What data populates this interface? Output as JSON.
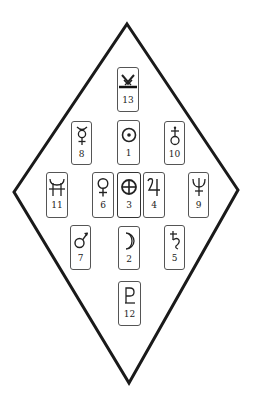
{
  "diagram": {
    "shape": "diamond",
    "vertices": {
      "top": [
        127,
        24
      ],
      "right": [
        238,
        190
      ],
      "bottom": [
        129,
        383
      ],
      "left": [
        14,
        192
      ]
    },
    "stroke_color": "#1a1a1a",
    "cards": [
      {
        "number": "13",
        "symbol": "uranian-vulcanus-icon",
        "x": 117,
        "y": 67,
        "w": 22,
        "h": 45
      },
      {
        "number": "8",
        "symbol": "mercury-icon",
        "x": 71,
        "y": 121,
        "w": 21,
        "h": 44
      },
      {
        "number": "1",
        "symbol": "sun-icon",
        "x": 117,
        "y": 120,
        "w": 23,
        "h": 45
      },
      {
        "number": "10",
        "symbol": "uranus-icon",
        "x": 164,
        "y": 121,
        "w": 21,
        "h": 44
      },
      {
        "number": "11",
        "symbol": "neptune-alt-icon",
        "x": 46,
        "y": 172,
        "w": 22,
        "h": 46
      },
      {
        "number": "6",
        "symbol": "venus-icon",
        "x": 92,
        "y": 172,
        "w": 22,
        "h": 46
      },
      {
        "number": "3",
        "symbol": "earth-icon",
        "x": 117,
        "y": 172,
        "w": 24,
        "h": 46
      },
      {
        "number": "4",
        "symbol": "jupiter-icon",
        "x": 143,
        "y": 172,
        "w": 22,
        "h": 46
      },
      {
        "number": "9",
        "symbol": "neptune-icon",
        "x": 188,
        "y": 172,
        "w": 21,
        "h": 46
      },
      {
        "number": "7",
        "symbol": "mars-icon",
        "x": 70,
        "y": 225,
        "w": 21,
        "h": 45
      },
      {
        "number": "2",
        "symbol": "moon-icon",
        "x": 118,
        "y": 226,
        "w": 22,
        "h": 44
      },
      {
        "number": "5",
        "symbol": "saturn-icon",
        "x": 164,
        "y": 225,
        "w": 21,
        "h": 45
      },
      {
        "number": "12",
        "symbol": "pluto-icon",
        "x": 118,
        "y": 281,
        "w": 23,
        "h": 45
      }
    ]
  }
}
